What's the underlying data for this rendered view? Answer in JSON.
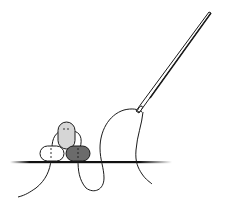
{
  "illustration": {
    "subject": "Beading needle and thread stitching three beads onto fabric",
    "caption": "Needle threading beads",
    "colors": {
      "background": "#ffffff",
      "stroke": "#1a1a1a",
      "bead_top": "#d6d6d6",
      "bead_left": "#ffffff",
      "bead_right": "#6b6b6b",
      "fabric_line": "#111111"
    },
    "beads": [
      {
        "name": "top",
        "fill": "light-gray"
      },
      {
        "name": "bottom-left",
        "fill": "white"
      },
      {
        "name": "bottom-right",
        "fill": "dark-gray"
      }
    ]
  }
}
